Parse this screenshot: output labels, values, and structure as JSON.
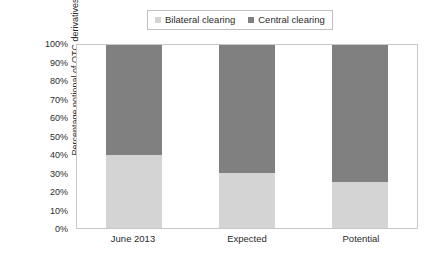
{
  "legend": {
    "position": "top",
    "entries": [
      {
        "label": "Bilateral clearing",
        "color": "#d4d4d4"
      },
      {
        "label": "Central clearing",
        "color": "#808080"
      }
    ]
  },
  "axes": {
    "ylabel": "Percentage notional of OTC derivatives",
    "xlabel": "",
    "yticks": [
      "100%",
      "90%",
      "80%",
      "70%",
      "60%",
      "50%",
      "40%",
      "30%",
      "20%",
      "10%",
      "0%"
    ]
  },
  "chart_data": {
    "type": "bar",
    "stacked": true,
    "title": "",
    "subtitle": "",
    "xlabel": "",
    "ylabel": "Percentage notional of OTC derivatives",
    "ylim": [
      0,
      100
    ],
    "ytick_values": [
      0,
      10,
      20,
      30,
      40,
      50,
      60,
      70,
      80,
      90,
      100
    ],
    "ytick_labels": [
      "0%",
      "10%",
      "20%",
      "30%",
      "40%",
      "50%",
      "60%",
      "70%",
      "80%",
      "90%",
      "100%"
    ],
    "grid": false,
    "legend_position": "top",
    "categories": [
      "June 2013",
      "Expected",
      "Potential"
    ],
    "series": [
      {
        "name": "Bilateral clearing",
        "color": "#d4d4d4",
        "values": [
          40,
          30,
          25
        ]
      },
      {
        "name": "Central clearing",
        "color": "#808080",
        "values": [
          60,
          70,
          75
        ]
      }
    ],
    "annotations": []
  }
}
